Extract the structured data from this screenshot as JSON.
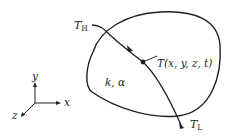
{
  "diagram": {
    "body_label": "k, α",
    "isotherm": {
      "high_label": "T",
      "high_sub": "H",
      "low_label": "T",
      "low_sub": "L"
    },
    "point_label": "T(x, y, z, t)",
    "axes": {
      "x": "x",
      "y": "y",
      "z": "z"
    },
    "colors": {
      "stroke": "#231f20",
      "background": "#ffffff"
    }
  }
}
